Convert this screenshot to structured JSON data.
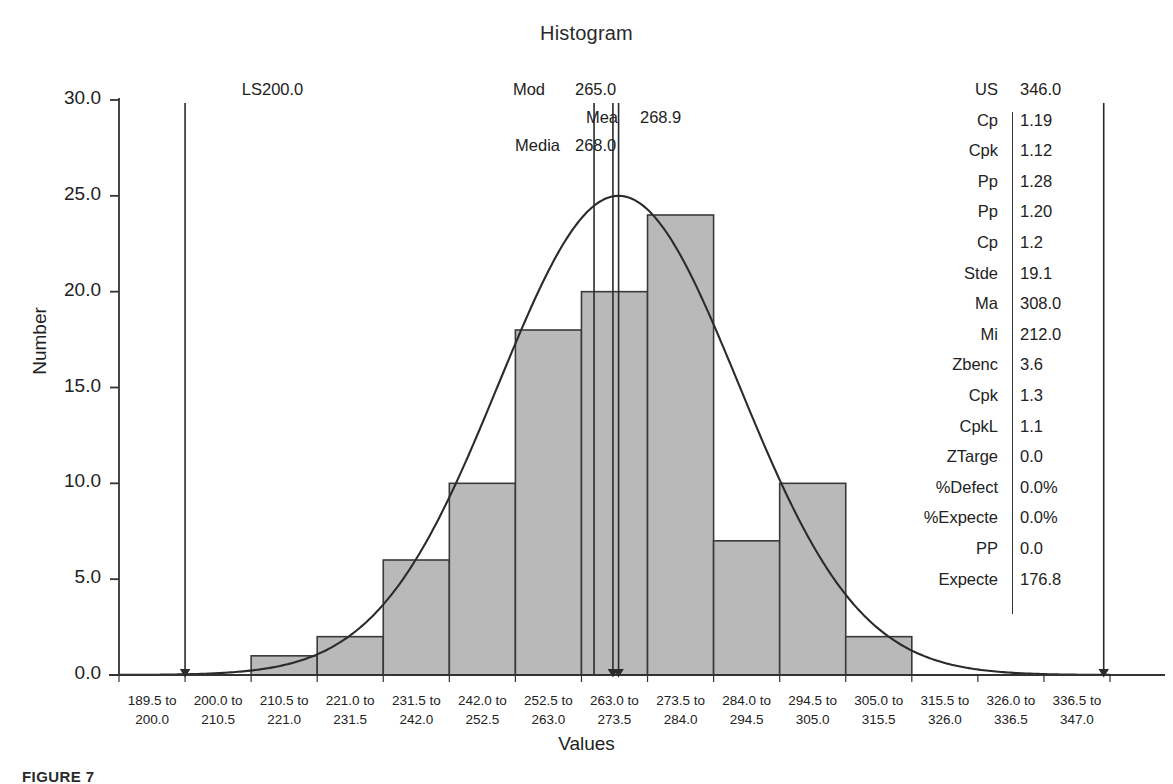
{
  "chart_data": {
    "type": "bar",
    "title": "Histogram",
    "xlabel": "Values",
    "ylabel": "Number",
    "ylim": [
      0,
      30
    ],
    "yticks": [
      "0.0",
      "5.0",
      "10.0",
      "15.0",
      "20.0",
      "25.0",
      "30.0"
    ],
    "ytick_values": [
      0,
      5,
      10,
      15,
      20,
      25,
      30
    ],
    "grid": false,
    "legend": "none",
    "categories": [
      "189.5 to 200.0",
      "200.0 to 210.5",
      "210.5 to 221.0",
      "221.0 to 231.5",
      "231.5 to 242.0",
      "242.0 to 252.5",
      "252.5 to 263.0",
      "263.0 to 273.5",
      "273.5 to 284.0",
      "284.0 to 294.5",
      "294.5 to 305.0",
      "305.0 to 315.5",
      "315.5 to 326.0",
      "326.0 to 336.5",
      "336.5 to 347.0"
    ],
    "bin_edges_low": [
      "189.5",
      "200.0",
      "210.5",
      "221.0",
      "231.5",
      "242.0",
      "252.5",
      "263.0",
      "273.5",
      "284.0",
      "294.5",
      "305.0",
      "315.5",
      "326.0",
      "336.5"
    ],
    "bin_edges_high": [
      "200.0",
      "210.5",
      "221.0",
      "231.5",
      "242.0",
      "252.5",
      "263.0",
      "273.5",
      "284.0",
      "294.5",
      "305.0",
      "315.5",
      "326.0",
      "336.5",
      "347.0"
    ],
    "values": [
      0,
      0,
      1,
      2,
      6,
      10,
      18,
      20,
      24,
      7,
      10,
      2,
      0,
      0,
      0
    ],
    "overlay_curve": {
      "name": "normal-curve",
      "mean": 268.9,
      "std_dev": 19.1,
      "peak_value": 25.0
    },
    "bar_fill": "#b9b9b9",
    "bar_stroke": "#3a3a3a",
    "axis_color": "#333333"
  },
  "annotations": [
    {
      "name": "LSL",
      "label": "LS",
      "value": "200.0",
      "x_value": 200.0
    },
    {
      "name": "Mode",
      "label": "Mod",
      "value": "265.0",
      "x_value": 265.0
    },
    {
      "name": "Median",
      "label": "Media",
      "value": "268.0",
      "x_value": 268.0
    },
    {
      "name": "Mean",
      "label": "Mea",
      "value": "268.9",
      "x_value": 268.9
    },
    {
      "name": "USL",
      "label": "US",
      "value": "346.0",
      "x_value": 346.0
    }
  ],
  "stats": {
    "rows": [
      {
        "key": "US",
        "value": "346.0"
      },
      {
        "key": "Cp",
        "value": "1.19"
      },
      {
        "key": "Cpk",
        "value": "1.12"
      },
      {
        "key": "Pp",
        "value": "1.28"
      },
      {
        "key": "Pp",
        "value": "1.20"
      },
      {
        "key": "Cp",
        "value": "1.2"
      },
      {
        "key": "Stde",
        "value": "19.1"
      },
      {
        "key": "Ma",
        "value": "308.0"
      },
      {
        "key": "Mi",
        "value": "212.0"
      },
      {
        "key": "Zbenc",
        "value": "3.6"
      },
      {
        "key": "Cpk",
        "value": "1.3"
      },
      {
        "key": "CpkL",
        "value": "1.1"
      },
      {
        "key": "ZTarge",
        "value": "0.0"
      },
      {
        "key": "%Defect",
        "value": "0.0%"
      },
      {
        "key": "%Expecte",
        "value": "0.0%"
      },
      {
        "key": "PP",
        "value": "0.0"
      },
      {
        "key": "Expecte",
        "value": "176.8"
      }
    ]
  },
  "caption": "FIGURE 7"
}
